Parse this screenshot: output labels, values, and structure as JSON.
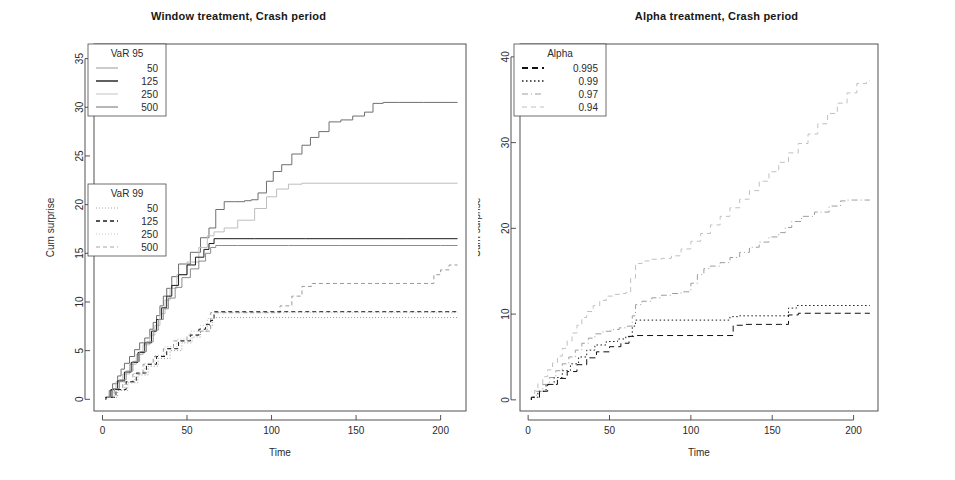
{
  "figure": {
    "background": "#ffffff",
    "ink": "#2b2b2b"
  },
  "panels": [
    {
      "id": "window-treatment",
      "title": "Window treatment, Crash period",
      "xlabel": "Time",
      "ylabel": "Cum surprise",
      "legends": [
        {
          "id": "var95",
          "title": "VaR 95",
          "entries": [
            {
              "label": "50",
              "dash": "none",
              "color": "#8d8d8d",
              "width": 0.9
            },
            {
              "label": "125",
              "dash": "none",
              "color": "#1c1c1c",
              "width": 1.4
            },
            {
              "label": "250",
              "dash": "none",
              "color": "#bdbdbd",
              "width": 0.9
            },
            {
              "label": "500",
              "dash": "none",
              "color": "#6f6f6f",
              "width": 1.0
            }
          ]
        },
        {
          "id": "var99",
          "title": "VaR 99",
          "entries": [
            {
              "label": "50",
              "dash": "1,2",
              "color": "#9a9a9a",
              "width": 0.9
            },
            {
              "label": "125",
              "dash": "4,3",
              "color": "#1c1c1c",
              "width": 1.3
            },
            {
              "label": "250",
              "dash": "1,2",
              "color": "#c2c2c2",
              "width": 0.9
            },
            {
              "label": "500",
              "dash": "4,3",
              "color": "#9a9a9a",
              "width": 0.9
            }
          ]
        }
      ]
    },
    {
      "id": "alpha-treatment",
      "title": "Alpha treatment, Crash period",
      "xlabel": "Time",
      "ylabel": "Cum surprise",
      "legends": [
        {
          "id": "alpha",
          "title": "Alpha",
          "entries": [
            {
              "label": "0.995",
              "dash": "6,4",
              "color": "#111111",
              "width": 2.0
            },
            {
              "label": "0.99",
              "dash": "1.5,2.5",
              "color": "#1c1c1c",
              "width": 1.6
            },
            {
              "label": "0.97",
              "dash": "6,3,1,3",
              "color": "#9d9d9d",
              "width": 1.0
            },
            {
              "label": "0.94",
              "dash": "5,4",
              "color": "#c0c0c0",
              "width": 1.0
            }
          ]
        }
      ]
    }
  ],
  "chart_data": [
    {
      "type": "line",
      "panel": "window-treatment",
      "title": "Window treatment, Crash period",
      "xlabel": "Time",
      "ylabel": "Cum surprise",
      "xlim": [
        -5,
        215
      ],
      "ylim": [
        -1.2,
        36.5
      ],
      "xticks": [
        0,
        50,
        100,
        150,
        200
      ],
      "yticks": [
        0,
        5,
        10,
        15,
        20,
        25,
        30,
        35
      ],
      "grid": false,
      "legend_position": "left-inside",
      "step": "post",
      "series": [
        {
          "name": "VaR 95 / 500",
          "group": "VaR 95",
          "window": 500,
          "style": {
            "dash": "none",
            "color": "#6f6f6f",
            "width": 1.0
          },
          "x": [
            2,
            4,
            6,
            9,
            11,
            13,
            16,
            19,
            22,
            25,
            28,
            30,
            32,
            34,
            36,
            38,
            41,
            45,
            52,
            58,
            63,
            67,
            72,
            78,
            84,
            88,
            92,
            97,
            101,
            106,
            112,
            118,
            123,
            128,
            134,
            141,
            148,
            155,
            160,
            166,
            175,
            190,
            205,
            210
          ],
          "y": [
            0.2,
            0.9,
            1.6,
            2.4,
            3.1,
            3.7,
            4.4,
            5.1,
            5.8,
            6.3,
            7.2,
            7.9,
            8.6,
            9.6,
            10.6,
            11.4,
            12.6,
            13.9,
            15.1,
            16.6,
            17.6,
            19.5,
            20.3,
            20.3,
            20.4,
            20.5,
            21.2,
            22.4,
            23.4,
            24.1,
            25.2,
            26.1,
            26.9,
            27.5,
            28.5,
            28.7,
            29.1,
            29.5,
            30.4,
            30.5,
            30.5,
            30.5,
            30.5,
            30.5
          ]
        },
        {
          "name": "VaR 95 / 250",
          "group": "VaR 95",
          "window": 250,
          "style": {
            "dash": "none",
            "color": "#bdbdbd",
            "width": 0.9
          },
          "x": [
            2,
            5,
            8,
            12,
            16,
            20,
            24,
            28,
            31,
            34,
            37,
            40,
            44,
            50,
            57,
            62,
            66,
            72,
            80,
            90,
            97,
            103,
            110,
            118,
            125,
            135,
            150,
            170,
            190,
            210
          ],
          "y": [
            0.2,
            1.0,
            1.8,
            2.6,
            3.6,
            4.6,
            5.6,
            6.6,
            7.6,
            8.8,
            10.2,
            11.4,
            12.8,
            14.1,
            15.6,
            16.8,
            17.2,
            17.6,
            18.4,
            19.6,
            20.8,
            21.6,
            22.1,
            22.2,
            22.2,
            22.2,
            22.2,
            22.2,
            22.2,
            22.2
          ]
        },
        {
          "name": "VaR 95 / 125",
          "group": "VaR 95",
          "window": 125,
          "style": {
            "dash": "none",
            "color": "#1c1c1c",
            "width": 1.4
          },
          "x": [
            2,
            5,
            9,
            13,
            17,
            21,
            25,
            29,
            32,
            35,
            38,
            41,
            45,
            50,
            55,
            60,
            63,
            66,
            70,
            90,
            120,
            150,
            180,
            210
          ],
          "y": [
            0.2,
            1.0,
            1.9,
            2.8,
            3.8,
            4.8,
            5.8,
            7.0,
            8.2,
            9.4,
            10.6,
            11.7,
            12.8,
            13.8,
            14.6,
            15.4,
            16.0,
            16.5,
            16.5,
            16.5,
            16.5,
            16.5,
            16.5,
            16.5
          ]
        },
        {
          "name": "VaR 95 / 50",
          "group": "VaR 95",
          "window": 50,
          "style": {
            "dash": "none",
            "color": "#8d8d8d",
            "width": 0.9
          },
          "x": [
            2,
            6,
            10,
            14,
            18,
            22,
            26,
            30,
            33,
            36,
            39,
            43,
            47,
            52,
            57,
            61,
            64,
            67,
            80,
            110,
            140,
            170,
            200,
            210
          ],
          "y": [
            0.2,
            1.1,
            2.0,
            2.9,
            3.9,
            4.9,
            5.9,
            7.1,
            8.2,
            9.3,
            10.4,
            11.5,
            12.5,
            13.4,
            14.2,
            15.0,
            15.6,
            15.8,
            15.8,
            15.8,
            15.8,
            15.8,
            15.8,
            15.8
          ]
        },
        {
          "name": "VaR 99 / 500",
          "group": "VaR 99",
          "window": 500,
          "style": {
            "dash": "4,3",
            "color": "#9a9a9a",
            "width": 0.9
          },
          "x": [
            2,
            7,
            12,
            18,
            24,
            30,
            36,
            42,
            50,
            58,
            64,
            70,
            80,
            95,
            105,
            112,
            118,
            124,
            130,
            145,
            165,
            185,
            196,
            200,
            205,
            210
          ],
          "y": [
            0.2,
            1.0,
            1.8,
            2.6,
            3.6,
            4.4,
            5.2,
            6.0,
            6.6,
            7.0,
            8.9,
            8.9,
            8.9,
            8.9,
            9.6,
            10.6,
            11.6,
            11.9,
            11.9,
            11.9,
            11.9,
            11.9,
            12.8,
            13.3,
            13.8,
            13.8
          ]
        },
        {
          "name": "VaR 99 / 250",
          "group": "VaR 99",
          "window": 250,
          "style": {
            "dash": "1,2",
            "color": "#c2c2c2",
            "width": 0.9
          },
          "x": [
            2,
            7,
            13,
            19,
            25,
            31,
            37,
            44,
            52,
            58,
            62,
            66,
            90,
            120,
            150,
            180,
            210
          ],
          "y": [
            0.2,
            1.0,
            1.8,
            2.7,
            3.7,
            4.5,
            5.4,
            6.2,
            7.0,
            7.6,
            8.3,
            8.9,
            8.9,
            8.9,
            8.9,
            8.9,
            8.9
          ]
        },
        {
          "name": "VaR 99 / 125",
          "group": "VaR 99",
          "window": 125,
          "style": {
            "dash": "4,3",
            "color": "#1c1c1c",
            "width": 1.3
          },
          "x": [
            2,
            8,
            14,
            20,
            26,
            32,
            38,
            45,
            52,
            57,
            61,
            64,
            66,
            90,
            120,
            150,
            180,
            210
          ],
          "y": [
            0.2,
            1.0,
            1.8,
            2.7,
            3.6,
            4.4,
            5.2,
            6.0,
            6.6,
            7.2,
            7.7,
            8.1,
            9.0,
            9.0,
            9.0,
            9.0,
            9.0,
            9.0
          ]
        },
        {
          "name": "VaR 99 / 50",
          "group": "VaR 99",
          "window": 50,
          "style": {
            "dash": "1,2",
            "color": "#9a9a9a",
            "width": 0.9
          },
          "x": [
            2,
            9,
            15,
            21,
            27,
            33,
            40,
            47,
            53,
            58,
            62,
            65,
            90,
            120,
            150,
            180,
            210
          ],
          "y": [
            0.2,
            0.9,
            1.7,
            2.5,
            3.4,
            4.2,
            5.0,
            5.8,
            6.4,
            7.0,
            7.6,
            8.4,
            8.4,
            8.4,
            8.4,
            8.4,
            8.4
          ]
        }
      ]
    },
    {
      "type": "line",
      "panel": "alpha-treatment",
      "title": "Alpha treatment, Crash period",
      "xlabel": "Time",
      "ylabel": "Cum surprise",
      "xlim": [
        -5,
        215
      ],
      "ylim": [
        -1.3,
        41.5
      ],
      "xticks": [
        0,
        50,
        100,
        150,
        200
      ],
      "yticks": [
        0,
        10,
        20,
        30,
        40
      ],
      "grid": false,
      "legend_position": "top-left-inside",
      "step": "post",
      "series": [
        {
          "name": "0.94",
          "alpha": 0.94,
          "style": {
            "dash": "5,4",
            "color": "#c0c0c0",
            "width": 1.0
          },
          "x": [
            2,
            4,
            6,
            9,
            12,
            15,
            18,
            21,
            24,
            27,
            30,
            33,
            36,
            40,
            44,
            48,
            52,
            56,
            60,
            63,
            66,
            70,
            76,
            82,
            88,
            94,
            100,
            106,
            112,
            118,
            124,
            130,
            136,
            142,
            148,
            154,
            160,
            166,
            172,
            178,
            184,
            190,
            196,
            202,
            208,
            210
          ],
          "y": [
            0.3,
            1.1,
            1.9,
            2.7,
            3.5,
            4.3,
            5.1,
            6.0,
            6.9,
            7.8,
            8.7,
            9.6,
            10.3,
            11.0,
            11.6,
            12.1,
            12.3,
            12.4,
            12.5,
            14.2,
            15.9,
            16.2,
            16.4,
            16.5,
            16.8,
            17.6,
            18.5,
            19.4,
            20.4,
            21.4,
            22.4,
            23.4,
            24.4,
            25.5,
            26.6,
            27.7,
            28.8,
            29.9,
            31.0,
            32.2,
            33.4,
            34.6,
            35.8,
            36.9,
            37.2,
            37.2
          ]
        },
        {
          "name": "0.97",
          "alpha": 0.97,
          "style": {
            "dash": "6,3,1,3",
            "color": "#9d9d9d",
            "width": 1.0
          },
          "x": [
            2,
            5,
            9,
            13,
            17,
            21,
            25,
            29,
            33,
            37,
            41,
            46,
            51,
            56,
            61,
            64,
            66,
            70,
            76,
            82,
            88,
            94,
            100,
            104,
            108,
            112,
            118,
            124,
            130,
            136,
            142,
            148,
            154,
            158,
            162,
            168,
            176,
            185,
            192,
            196,
            200,
            205,
            210
          ],
          "y": [
            0.3,
            1.0,
            1.8,
            2.6,
            3.4,
            4.2,
            5.0,
            5.8,
            6.6,
            7.2,
            7.7,
            8.0,
            8.2,
            8.4,
            8.6,
            9.8,
            11.1,
            11.5,
            11.9,
            12.2,
            12.4,
            12.6,
            13.6,
            14.6,
            15.3,
            15.6,
            16.0,
            16.6,
            17.2,
            17.8,
            18.4,
            19.0,
            19.5,
            20.1,
            20.8,
            21.4,
            21.9,
            22.6,
            23.2,
            23.3,
            23.3,
            23.3,
            23.3
          ]
        },
        {
          "name": "0.99",
          "alpha": 0.99,
          "style": {
            "dash": "1.5,2.5",
            "color": "#1c1c1c",
            "width": 1.6
          },
          "x": [
            2,
            6,
            11,
            16,
            21,
            26,
            31,
            36,
            41,
            48,
            55,
            60,
            64,
            66,
            90,
            118,
            124,
            130,
            145,
            155,
            160,
            165,
            175,
            190,
            205,
            210
          ],
          "y": [
            0.3,
            1.0,
            1.8,
            2.6,
            3.4,
            4.2,
            5.0,
            5.8,
            6.4,
            6.8,
            7.1,
            7.4,
            8.6,
            9.3,
            9.3,
            9.3,
            9.7,
            9.8,
            9.8,
            9.8,
            10.7,
            11.0,
            11.0,
            11.0,
            11.0,
            11.0
          ]
        },
        {
          "name": "0.995",
          "alpha": 0.995,
          "style": {
            "dash": "6,4",
            "color": "#111111",
            "width": 2.0
          },
          "x": [
            2,
            7,
            12,
            18,
            24,
            30,
            36,
            42,
            50,
            57,
            62,
            66,
            90,
            118,
            126,
            132,
            145,
            155,
            160,
            166,
            175,
            190,
            205,
            210
          ],
          "y": [
            0.3,
            1.0,
            1.8,
            2.5,
            3.3,
            4.1,
            4.9,
            5.6,
            6.2,
            6.6,
            7.4,
            7.5,
            7.5,
            7.5,
            8.7,
            8.8,
            8.8,
            8.8,
            9.9,
            10.1,
            10.1,
            10.1,
            10.1,
            10.1
          ]
        }
      ]
    }
  ]
}
